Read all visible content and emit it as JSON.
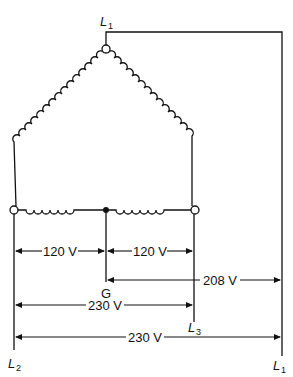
{
  "diagram": {
    "type": "delta transformer with center-tapped winding (high-leg delta)",
    "terminals": {
      "top": "L1",
      "left": "L2",
      "right_bottom": "L3",
      "center_tap": "G",
      "far_right": "L1"
    },
    "labels": {
      "L1_top_letter": "L",
      "L1_top_sub": "1",
      "L2_letter": "L",
      "L2_sub": "2",
      "L3_letter": "L",
      "L3_sub": "3",
      "L1_right_letter": "L",
      "L1_right_sub": "1",
      "G": "G"
    },
    "measurements": [
      {
        "from": "L2",
        "to": "G",
        "label": "120 V"
      },
      {
        "from": "G",
        "to": "L3",
        "label": "120 V"
      },
      {
        "from": "G",
        "to": "L1",
        "label": "208 V"
      },
      {
        "from": "L2",
        "to": "L3",
        "label": "230 V"
      },
      {
        "from": "L2",
        "to": "L1",
        "label": "230 V"
      }
    ],
    "colors": {
      "line": "#111111",
      "background": "#ffffff"
    }
  }
}
